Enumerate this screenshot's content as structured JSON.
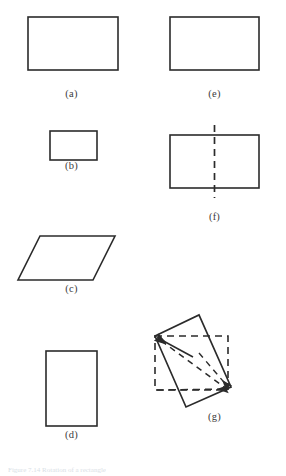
{
  "page": {
    "background_color": "#ffffff",
    "stroke_color": "#2b2b2b",
    "caption_color": "#3b3b3b",
    "width": 286,
    "height": 476
  },
  "figure": {
    "panels": [
      {
        "id": "a",
        "caption": "(a)",
        "shape": "rectangle",
        "description": "wide rectangle outline"
      },
      {
        "id": "b",
        "caption": "(b)",
        "shape": "rectangle",
        "description": "small wide rectangle outline"
      },
      {
        "id": "c",
        "caption": "(c)",
        "shape": "parallelogram",
        "description": "parallelogram slanted to the right"
      },
      {
        "id": "d",
        "caption": "(d)",
        "shape": "rectangle",
        "description": "tall portrait rectangle outline"
      },
      {
        "id": "e",
        "caption": "(e)",
        "shape": "rectangle",
        "description": "wide rectangle outline"
      },
      {
        "id": "f",
        "caption": "(f)",
        "shape": "rectangle-with-axis",
        "description": "rectangle with vertical dashed line of symmetry through its centre"
      },
      {
        "id": "g",
        "caption": "(g)",
        "shape": "rotated-quadrilateral-over-dashed-square",
        "description": "dashed square with a rotated solid quadrilateral overlaid and a dashed diagonal with arrowheads at two opposite corners"
      }
    ]
  },
  "bottom_caption": {
    "text": "Figure 7.14  Rotation of a rectangle"
  }
}
